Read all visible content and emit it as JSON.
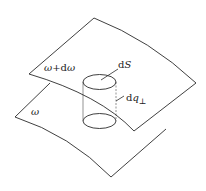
{
  "diagram": {
    "colors": {
      "line": "#2a2a2a",
      "background": "#ffffff"
    },
    "labels": {
      "upper_surface": {
        "sym": "ω",
        "op": "+d",
        "sym2": "ω"
      },
      "lower_surface": {
        "sym": "ω"
      },
      "area_element": {
        "d": "d",
        "var": "S"
      },
      "normal_distance": {
        "d": "d",
        "var": "q",
        "sub": "⊥"
      }
    }
  }
}
